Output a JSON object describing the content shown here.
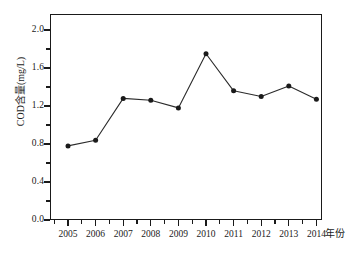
{
  "chart_data": {
    "type": "line",
    "title": "",
    "xlabel": "年份",
    "ylabel": "COD含量(mg/L)",
    "categories": [
      "2005",
      "2006",
      "2007",
      "2008",
      "2009",
      "2010",
      "2011",
      "2012",
      "2013",
      "2014"
    ],
    "values": [
      0.78,
      0.84,
      1.28,
      1.26,
      1.18,
      1.75,
      1.36,
      1.3,
      1.41,
      1.27
    ],
    "series": [
      {
        "name": "COD含量",
        "values": [
          0.78,
          0.84,
          1.28,
          1.26,
          1.18,
          1.75,
          1.36,
          1.3,
          1.41,
          1.27
        ]
      }
    ],
    "ylim": [
      0.0,
      2.0
    ],
    "y_major_ticks": [
      "0.0",
      "0.4",
      "0.8",
      "1.2",
      "1.6",
      "2.0"
    ],
    "y_major_tick_values": [
      0.0,
      0.4,
      0.8,
      1.2,
      1.6,
      2.0
    ],
    "y_minor_tick_values": [
      0.2,
      0.6,
      1.0,
      1.4,
      1.8
    ],
    "grid": false,
    "legend": null,
    "marker": "filled-circle",
    "line_color": "#2b2b2b",
    "marker_color": "#1a1a1a",
    "frame_color": "#1a1a1a",
    "background_color": "#ffffff"
  }
}
